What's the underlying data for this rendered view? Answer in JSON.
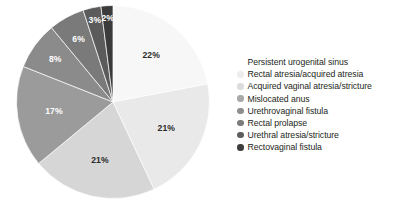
{
  "chart_data": {
    "type": "pie",
    "title": "",
    "subtitle": "",
    "xlabel": "",
    "ylabel": "",
    "grid": false,
    "legend_position": "right",
    "start_angle_deg": 0,
    "direction": "clockwise",
    "units": "percent",
    "categories": [
      "Persistent urogenital sinus",
      "Rectal atresia/acquired atresia",
      "Acquired vaginal atresia/stricture",
      "Mislocated anus",
      "Urethrovaginal fistula",
      "Rectal prolapse",
      "Urethral atresia/stricture",
      "Rectovaginal fistula"
    ],
    "values": [
      22,
      21,
      21,
      17,
      8,
      6,
      3,
      2
    ],
    "data_labels": [
      "22%",
      "21%",
      "21%",
      "17%",
      "8%",
      "6%",
      "3%",
      "2%"
    ],
    "colors": [
      "#f7f7f7",
      "#e9e9e9",
      "#d6d6d6",
      "#9b9b9b",
      "#8b8b8b",
      "#7a7a7a",
      "#5b5b5b",
      "#3b3b3b"
    ],
    "label_text_colors": [
      "dark",
      "dark",
      "dark",
      "light",
      "light",
      "light",
      "light",
      "light"
    ],
    "slices": [
      {
        "label": "Persistent urogenital sinus",
        "value": 22,
        "data_label": "22%",
        "color": "#f7f7f7",
        "label_color": "dark"
      },
      {
        "label": "Rectal atresia/acquired atresia",
        "value": 21,
        "data_label": "21%",
        "color": "#e9e9e9",
        "label_color": "dark"
      },
      {
        "label": "Acquired vaginal atresia/stricture",
        "value": 21,
        "data_label": "21%",
        "color": "#d6d6d6",
        "label_color": "dark"
      },
      {
        "label": "Mislocated anus",
        "value": 17,
        "data_label": "17%",
        "color": "#9b9b9b",
        "label_color": "light"
      },
      {
        "label": "Urethrovaginal fistula",
        "value": 8,
        "data_label": "8%",
        "color": "#8b8b8b",
        "label_color": "light"
      },
      {
        "label": "Rectal prolapse",
        "value": 6,
        "data_label": "6%",
        "color": "#7a7a7a",
        "label_color": "light"
      },
      {
        "label": "Urethral atresia/stricture",
        "value": 3,
        "data_label": "3%",
        "color": "#5b5b5b",
        "label_color": "light"
      },
      {
        "label": "Rectovaginal fistula",
        "value": 2,
        "data_label": "2%",
        "color": "#3b3b3b",
        "label_color": "light"
      }
    ]
  },
  "legend": {
    "items": [
      {
        "label": "Persistent urogenital sinus",
        "color": "#f7f7f7",
        "swatch_visible": false
      },
      {
        "label": "Rectal atresia/acquired atresia",
        "color": "#ededed",
        "swatch_visible": true
      },
      {
        "label": "Acquired vaginal atresia/stricture",
        "color": "#dcdcdc",
        "swatch_visible": true
      },
      {
        "label": "Mislocated anus",
        "color": "#a8a8a8",
        "swatch_visible": true
      },
      {
        "label": "Urethrovaginal fistula",
        "color": "#8e8e8e",
        "swatch_visible": true
      },
      {
        "label": "Rectal prolapse",
        "color": "#7c7c7c",
        "swatch_visible": true
      },
      {
        "label": "Urethral atresia/stricture",
        "color": "#5d5d5d",
        "swatch_visible": true
      },
      {
        "label": "Rectovaginal fistula",
        "color": "#3d3d3d",
        "swatch_visible": true
      }
    ]
  },
  "colors": {
    "background": "#ffffff",
    "text": "#231f20",
    "slice_border": "#ffffff",
    "label_dark": "#2b2b2b",
    "label_light": "#ffffff"
  }
}
